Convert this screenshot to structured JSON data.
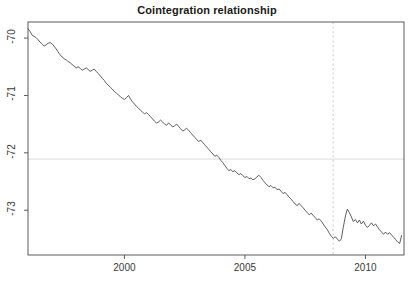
{
  "chart_data": {
    "type": "line",
    "title": "Cointegration relationship",
    "xlabel": "",
    "ylabel": "",
    "xlim": [
      1996.0,
      2011.6
    ],
    "ylim": [
      -73.78,
      -69.72
    ],
    "xticks": [
      2000,
      2005,
      2010
    ],
    "xtick_labels": [
      "2000",
      "2005",
      "2010"
    ],
    "yticks": [
      -70,
      -71,
      -72,
      -73
    ],
    "ytick_labels": [
      "-70",
      "-71",
      "-72",
      "-73"
    ],
    "grid": false,
    "legend": null,
    "annotations": [
      {
        "name": "mean-reference-line",
        "type": "hline",
        "y": -72.11,
        "style": "solid",
        "color": "#e2e2e2"
      },
      {
        "name": "break-date-line",
        "type": "vline",
        "x": 2008.66,
        "style": "dashed",
        "color": "#d3d3d3"
      }
    ],
    "series": [
      {
        "name": "cointegration residual",
        "color": "#4d4d4d",
        "x": [
          1996.0,
          1996.08,
          1996.17,
          1996.25,
          1996.33,
          1996.42,
          1996.5,
          1996.58,
          1996.67,
          1996.75,
          1996.83,
          1996.92,
          1997.0,
          1997.08,
          1997.17,
          1997.25,
          1997.33,
          1997.42,
          1997.5,
          1997.58,
          1997.67,
          1997.75,
          1997.83,
          1997.92,
          1998.0,
          1998.08,
          1998.17,
          1998.25,
          1998.33,
          1998.42,
          1998.5,
          1998.58,
          1998.67,
          1998.75,
          1998.83,
          1998.92,
          1999.0,
          1999.08,
          1999.17,
          1999.25,
          1999.33,
          1999.42,
          1999.5,
          1999.58,
          1999.67,
          1999.75,
          1999.83,
          1999.92,
          2000.0,
          2000.08,
          2000.17,
          2000.25,
          2000.33,
          2000.42,
          2000.5,
          2000.58,
          2000.67,
          2000.75,
          2000.83,
          2000.92,
          2001.0,
          2001.08,
          2001.17,
          2001.25,
          2001.33,
          2001.42,
          2001.5,
          2001.58,
          2001.67,
          2001.75,
          2001.83,
          2001.92,
          2002.0,
          2002.08,
          2002.17,
          2002.25,
          2002.33,
          2002.42,
          2002.5,
          2002.58,
          2002.67,
          2002.75,
          2002.83,
          2002.92,
          2003.0,
          2003.08,
          2003.17,
          2003.25,
          2003.33,
          2003.42,
          2003.5,
          2003.58,
          2003.67,
          2003.75,
          2003.83,
          2003.92,
          2004.0,
          2004.08,
          2004.17,
          2004.25,
          2004.33,
          2004.42,
          2004.5,
          2004.58,
          2004.67,
          2004.75,
          2004.83,
          2004.92,
          2005.0,
          2005.08,
          2005.17,
          2005.25,
          2005.33,
          2005.42,
          2005.5,
          2005.58,
          2005.67,
          2005.75,
          2005.83,
          2005.92,
          2006.0,
          2006.08,
          2006.17,
          2006.25,
          2006.33,
          2006.42,
          2006.5,
          2006.58,
          2006.67,
          2006.75,
          2006.83,
          2006.92,
          2007.0,
          2007.08,
          2007.17,
          2007.25,
          2007.33,
          2007.42,
          2007.5,
          2007.58,
          2007.67,
          2007.75,
          2007.83,
          2007.92,
          2008.0,
          2008.08,
          2008.17,
          2008.25,
          2008.33,
          2008.42,
          2008.5,
          2008.58,
          2008.67,
          2008.75,
          2008.83,
          2008.92,
          2009.0,
          2009.08,
          2009.17,
          2009.25,
          2009.33,
          2009.42,
          2009.5,
          2009.58,
          2009.67,
          2009.75,
          2009.83,
          2009.92,
          2010.0,
          2010.08,
          2010.17,
          2010.25,
          2010.33,
          2010.42,
          2010.5,
          2010.58,
          2010.67,
          2010.75,
          2010.83,
          2010.92,
          2011.0,
          2011.08,
          2011.17,
          2011.25,
          2011.33,
          2011.42,
          2011.5
        ],
        "y": [
          -69.84,
          -69.88,
          -69.95,
          -69.97,
          -69.99,
          -70.03,
          -70.07,
          -70.1,
          -70.14,
          -70.12,
          -70.09,
          -70.08,
          -70.1,
          -70.14,
          -70.19,
          -70.24,
          -70.29,
          -70.33,
          -70.36,
          -70.38,
          -70.41,
          -70.43,
          -70.46,
          -70.49,
          -70.52,
          -70.5,
          -70.53,
          -70.56,
          -70.54,
          -70.52,
          -70.55,
          -70.58,
          -70.56,
          -70.54,
          -70.58,
          -70.62,
          -70.66,
          -70.7,
          -70.74,
          -70.79,
          -70.82,
          -70.86,
          -70.89,
          -70.93,
          -70.96,
          -70.99,
          -71.02,
          -71.05,
          -71.07,
          -71.04,
          -71.0,
          -71.06,
          -71.11,
          -71.15,
          -71.19,
          -71.22,
          -71.26,
          -71.29,
          -71.32,
          -71.3,
          -71.33,
          -71.37,
          -71.41,
          -71.45,
          -71.48,
          -71.46,
          -71.43,
          -71.46,
          -71.5,
          -71.52,
          -71.48,
          -71.51,
          -71.55,
          -71.53,
          -71.5,
          -71.54,
          -71.58,
          -71.62,
          -71.6,
          -71.57,
          -71.61,
          -71.65,
          -71.69,
          -71.73,
          -71.77,
          -71.8,
          -71.78,
          -71.82,
          -71.86,
          -71.9,
          -71.94,
          -71.98,
          -72.02,
          -72.06,
          -72.04,
          -72.08,
          -72.13,
          -72.17,
          -72.22,
          -72.27,
          -72.31,
          -72.29,
          -72.33,
          -72.31,
          -72.35,
          -72.38,
          -72.36,
          -72.4,
          -72.43,
          -72.41,
          -72.45,
          -72.44,
          -72.47,
          -72.45,
          -72.42,
          -72.39,
          -72.43,
          -72.48,
          -72.52,
          -72.56,
          -72.59,
          -72.57,
          -72.61,
          -72.6,
          -72.64,
          -72.63,
          -72.67,
          -72.71,
          -72.69,
          -72.73,
          -72.77,
          -72.81,
          -72.85,
          -72.89,
          -72.92,
          -72.88,
          -72.92,
          -72.96,
          -73.0,
          -73.04,
          -73.08,
          -73.05,
          -73.09,
          -73.13,
          -73.17,
          -73.15,
          -73.19,
          -73.24,
          -73.29,
          -73.34,
          -73.4,
          -73.45,
          -73.49,
          -73.46,
          -73.5,
          -73.54,
          -73.5,
          -73.3,
          -73.1,
          -72.98,
          -73.04,
          -73.12,
          -73.2,
          -73.16,
          -73.22,
          -73.17,
          -73.24,
          -73.19,
          -73.26,
          -73.3,
          -73.26,
          -73.22,
          -73.27,
          -73.24,
          -73.29,
          -73.34,
          -73.38,
          -73.42,
          -73.38,
          -73.42,
          -73.39,
          -73.43,
          -73.47,
          -73.51,
          -73.55,
          -73.58,
          -73.44
        ]
      }
    ]
  },
  "axes": {
    "x_tick_labels": [
      "2000",
      "2005",
      "2010"
    ],
    "y_tick_labels": [
      "-70",
      "-71",
      "-72",
      "-73"
    ]
  }
}
